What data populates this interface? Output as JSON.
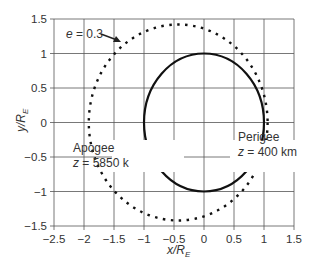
{
  "chart_data": {
    "type": "line",
    "title": "",
    "xlabel": "x/R_E",
    "ylabel": "y/R_E",
    "xlim": [
      -2.5,
      1.5
    ],
    "ylim": [
      -1.5,
      1.5
    ],
    "xticks": [
      "-2.5",
      "-2",
      "-1.5",
      "-1",
      "-0.5",
      "0",
      "0.5",
      "1",
      "1.5"
    ],
    "yticks": [
      "1.5",
      "1",
      "0.5",
      "0",
      "-0.5",
      "-1",
      "-1.5"
    ],
    "grid": true,
    "series": [
      {
        "name": "circular orbit",
        "style": "solid",
        "shape": "circle",
        "center": [
          0,
          0
        ],
        "radius": 1.0
      },
      {
        "name": "e = 0.3",
        "style": "dotted",
        "shape": "ellipse",
        "eccentricity": 0.3,
        "perigee_x": 1.06,
        "apogee_x": -1.92,
        "center": [
          -0.43,
          0
        ],
        "semi_major": 1.49,
        "semi_minor": 1.42
      }
    ],
    "annotations": [
      {
        "text": "e = 0.3",
        "x": -1.75,
        "y": 1.2,
        "arrow_to": [
          -1.1,
          1.1
        ]
      },
      {
        "text": "Apogee",
        "x": -2.2,
        "y": -0.35
      },
      {
        "text": "z = 5850 k",
        "x": -2.2,
        "y": -0.6
      },
      {
        "text": "Perigee",
        "x": 0.3,
        "y": -0.35
      },
      {
        "text": "z = 400 km",
        "x": 0.3,
        "y": -0.6
      }
    ]
  },
  "labels": {
    "e_label_italic": "e",
    "e_label_rest": " = 0.3",
    "apogee": "Apogee",
    "apogee_z_italic": "z",
    "apogee_z_rest": " = 5850 k",
    "perigee": "Perigee",
    "perigee_z_italic": "z",
    "perigee_z_rest": " = 400 km",
    "xlabel_main": "x/R",
    "xlabel_sub": "E",
    "ylabel_main": "y/R",
    "ylabel_sub": "E"
  }
}
